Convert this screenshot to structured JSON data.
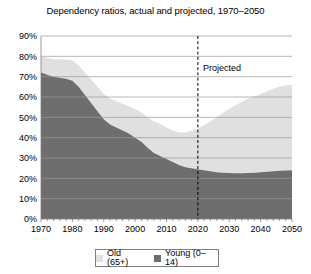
{
  "chart_data": {
    "type": "area",
    "title": "Dependency ratios, actual and projected, 1970–2050",
    "xlabel": "",
    "ylabel": "",
    "stacked": true,
    "grid": true,
    "legend_position": "bottom",
    "xlim": [
      1970,
      2050
    ],
    "ylim": [
      0,
      90
    ],
    "ytick_labels": [
      "0%",
      "10%",
      "20%",
      "30%",
      "40%",
      "50%",
      "60%",
      "70%",
      "80%",
      "90%"
    ],
    "ytick_values": [
      0,
      10,
      20,
      30,
      40,
      50,
      60,
      70,
      80,
      90
    ],
    "xtick_labels": [
      "1970",
      "1980",
      "1990",
      "2000",
      "2010",
      "2020",
      "2030",
      "2040",
      "2050"
    ],
    "xtick_values": [
      1970,
      1980,
      1990,
      2000,
      2010,
      2020,
      2030,
      2040,
      2050
    ],
    "annotations": [
      {
        "text": "Projected",
        "x": 2020,
        "y": 73,
        "line": "dashed-vertical"
      }
    ],
    "x": [
      1970,
      1972,
      1974,
      1976,
      1978,
      1980,
      1982,
      1984,
      1986,
      1988,
      1990,
      1992,
      1994,
      1996,
      1998,
      2000,
      2002,
      2004,
      2006,
      2008,
      2010,
      2012,
      2014,
      2016,
      2018,
      2020,
      2022,
      2024,
      2026,
      2028,
      2030,
      2032,
      2034,
      2036,
      2038,
      2040,
      2042,
      2044,
      2046,
      2048,
      2050
    ],
    "series": [
      {
        "name": "Young (0–14)",
        "color": "#6e6e6e",
        "values": [
          72,
          71,
          70,
          69.5,
          69,
          68,
          65,
          61,
          57,
          53,
          49,
          46.5,
          45,
          43.5,
          42,
          40,
          38,
          35,
          32.5,
          31,
          29.5,
          28,
          26.5,
          25.5,
          25,
          24.5,
          24,
          23.5,
          23,
          22.8,
          22.6,
          22.5,
          22.5,
          22.6,
          22.8,
          23,
          23.2,
          23.5,
          23.7,
          23.9,
          24
        ]
      },
      {
        "name": "Old (65+)",
        "color": "#e0e0e0",
        "values": [
          8,
          8.3,
          8.6,
          9,
          9.4,
          10,
          10.5,
          11,
          11.5,
          12,
          12.5,
          12.8,
          13,
          13.2,
          13.5,
          14,
          14.5,
          15,
          15.5,
          15.8,
          15.5,
          15.5,
          16,
          17,
          18.5,
          20,
          22,
          24.5,
          27,
          29.5,
          31.5,
          33.5,
          35,
          36.5,
          37.5,
          38.5,
          39.5,
          40.5,
          41.3,
          41.8,
          42
        ]
      }
    ],
    "totals": [
      80,
      79.3,
      78.6,
      78.5,
      78.4,
      78,
      75.5,
      72,
      68.5,
      65,
      61.5,
      59.3,
      58,
      56.7,
      55.5,
      54,
      52.5,
      50,
      48,
      46.8,
      45,
      43.5,
      42.5,
      42.5,
      43.5,
      44.5,
      46,
      48,
      50,
      52.3,
      54.1,
      56,
      57.5,
      59.1,
      60.3,
      61.5,
      62.7,
      64,
      65,
      65.7,
      66
    ]
  },
  "legend": {
    "items": [
      {
        "label": "Old (65+)",
        "color": "#e0e0e0"
      },
      {
        "label": "Young (0–14)",
        "color": "#6e6e6e"
      }
    ]
  }
}
